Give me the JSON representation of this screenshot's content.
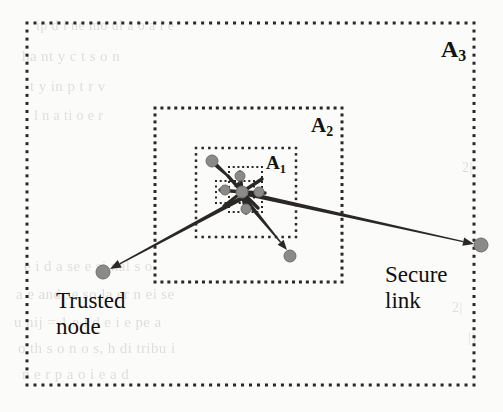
{
  "figure": {
    "type": "network-security-diagram",
    "background_color": "#fbfbfa",
    "node_color": "#8a8a8a",
    "node_edge_color": "#6e6e6e",
    "line_color": "#2b2724",
    "dot_color": "#2b2724"
  },
  "regions": [
    {
      "id": "A3",
      "label": "A",
      "sub": "3",
      "x": 27,
      "y": 23,
      "w": 447,
      "h": 362,
      "label_x": 441,
      "label_y": 36,
      "label_size": 24,
      "dot": 3,
      "gap": 5
    },
    {
      "id": "A2",
      "label": "A",
      "sub": "2",
      "x": 155,
      "y": 108,
      "w": 187,
      "h": 174,
      "label_x": 311,
      "label_y": 113,
      "label_size": 21,
      "dot": 3,
      "gap": 4
    },
    {
      "id": "A1",
      "label": "A",
      "sub": "1",
      "x": 196,
      "y": 148,
      "w": 100,
      "h": 89,
      "label_x": 266,
      "label_y": 152,
      "label_size": 19,
      "dot": 2.5,
      "gap": 4
    },
    {
      "id": "inner-a",
      "label": "",
      "sub": "",
      "x": 229,
      "y": 167,
      "w": 33,
      "h": 45,
      "label_x": 0,
      "label_y": 0,
      "label_size": 0,
      "dot": 2,
      "gap": 3
    },
    {
      "id": "inner-b",
      "label": "",
      "sub": "",
      "x": 216,
      "y": 181,
      "w": 38,
      "h": 22,
      "label_x": 0,
      "label_y": 0,
      "label_size": 0,
      "dot": 2,
      "gap": 3
    }
  ],
  "hub": {
    "x": 242,
    "y": 192
  },
  "nodes": [
    {
      "name": "trusted-node-left",
      "x": 103,
      "y": 272,
      "r": 7
    },
    {
      "name": "secure-link-right-node",
      "x": 481,
      "y": 245,
      "r": 7
    },
    {
      "name": "node-upper-left",
      "x": 212,
      "y": 161,
      "r": 6
    },
    {
      "name": "node-lower-right",
      "x": 290,
      "y": 256,
      "r": 6
    },
    {
      "name": "hub-node-center",
      "x": 242,
      "y": 192,
      "r": 6
    },
    {
      "name": "hub-node-up",
      "x": 240,
      "y": 176,
      "r": 5
    },
    {
      "name": "hub-node-down",
      "x": 246,
      "y": 209,
      "r": 5
    },
    {
      "name": "hub-node-west",
      "x": 225,
      "y": 190,
      "r": 5
    },
    {
      "name": "hub-node-east",
      "x": 259,
      "y": 192,
      "r": 5
    }
  ],
  "arrows": [
    {
      "name": "arrow-to-trusted-node",
      "x1": 246,
      "y1": 196,
      "x2": 110,
      "y2": 269,
      "width": 4.2,
      "head": 11
    },
    {
      "name": "arrow-to-secure-link",
      "x1": 248,
      "y1": 194,
      "x2": 474,
      "y2": 244,
      "width": 4.2,
      "head": 11
    },
    {
      "name": "arrow-to-lower-right",
      "x1": 244,
      "y1": 198,
      "x2": 287,
      "y2": 250,
      "width": 4.2,
      "head": 10
    },
    {
      "name": "arrow-from-upper-left",
      "x1": 216,
      "y1": 165,
      "x2": 243,
      "y2": 190,
      "width": 4.0,
      "head": 9
    }
  ],
  "spokes": [
    {
      "name": "spoke-n",
      "x1": 242,
      "y1": 192,
      "x2": 240,
      "y2": 172
    },
    {
      "name": "spoke-ne",
      "x1": 242,
      "y1": 192,
      "x2": 262,
      "y2": 179
    },
    {
      "name": "spoke-e",
      "x1": 242,
      "y1": 192,
      "x2": 265,
      "y2": 193
    },
    {
      "name": "spoke-se",
      "x1": 242,
      "y1": 192,
      "x2": 258,
      "y2": 208
    },
    {
      "name": "spoke-s",
      "x1": 242,
      "y1": 192,
      "x2": 246,
      "y2": 213
    },
    {
      "name": "spoke-sw",
      "x1": 242,
      "y1": 192,
      "x2": 224,
      "y2": 206
    },
    {
      "name": "spoke-w",
      "x1": 242,
      "y1": 192,
      "x2": 220,
      "y2": 190
    },
    {
      "name": "spoke-nw",
      "x1": 242,
      "y1": 192,
      "x2": 228,
      "y2": 176
    }
  ],
  "callouts": {
    "trusted_node": {
      "line1": "Trusted",
      "line2": "node",
      "x": 56,
      "y": 288,
      "size": 23
    },
    "secure_link": {
      "line1": "Secure",
      "line2": "link",
      "x": 385,
      "y": 262,
      "size": 23
    }
  },
  "background_text": [
    {
      "text": "ip  d  i ne  mo    ul      a  o  a  i   e",
      "x": 36,
      "y": 18,
      "size": 14
    },
    {
      "text": "ha    nt    y          c  t       s  o   n",
      "x": 22,
      "y": 48,
      "size": 15
    },
    {
      "text": "t      y            in    p    t   r     v",
      "x": 30,
      "y": 78,
      "size": 15
    },
    {
      "text": "l    n      a     ti   o        e   r",
      "x": 34,
      "y": 108,
      "size": 14
    },
    {
      "text": "2|",
      "x": 462,
      "y": 160,
      "size": 14
    },
    {
      "text": "e  i   d    a   se   e   si nal s  o",
      "x": 24,
      "y": 258,
      "size": 15
    },
    {
      "text": "a   e  and  se so   la er    n  ei se",
      "x": 16,
      "y": 286,
      "size": 15
    },
    {
      "text": "u  nij  =   1    e   l  d  e  i  e pe a",
      "x": 14,
      "y": 314,
      "size": 15
    },
    {
      "text": "o  th  s   o  n  o s,   h   di tribu i",
      "x": 18,
      "y": 340,
      "size": 15
    },
    {
      "text": "n e    r  p  a o  i    e    a  d",
      "x": 22,
      "y": 366,
      "size": 15
    },
    {
      "text": "2|",
      "x": 452,
      "y": 300,
      "size": 14
    },
    {
      "text": "|)",
      "x": 468,
      "y": 330,
      "size": 14
    }
  ]
}
